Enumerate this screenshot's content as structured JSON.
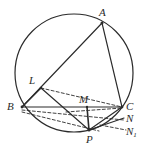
{
  "figure": {
    "type": "euclidean-geometry-diagram",
    "stroke_color": "#2b2b2b",
    "background_color": "#ffffff",
    "width": 146,
    "height": 151
  },
  "circle": {
    "name": "circumcircle",
    "cx": 74,
    "cy": 73,
    "r": 59,
    "stroke": "#2b2b2b",
    "stroke_width": 1.2,
    "fill": "none"
  },
  "points": [
    {
      "id": "A",
      "label": "A",
      "sub": "",
      "x": 102,
      "y": 23,
      "label_x": 99,
      "label_y": 7
    },
    {
      "id": "B",
      "label": "B",
      "sub": "",
      "x": 22,
      "y": 107,
      "label_x": 7,
      "label_y": 101
    },
    {
      "id": "C",
      "label": "C",
      "sub": "",
      "x": 122,
      "y": 107,
      "label_x": 126,
      "label_y": 101
    },
    {
      "id": "L",
      "label": "L",
      "sub": "",
      "x": 41,
      "y": 88,
      "label_x": 29,
      "label_y": 75
    },
    {
      "id": "M",
      "label": "M",
      "sub": "",
      "x": 87,
      "y": 107,
      "label_x": 79,
      "label_y": 94
    },
    {
      "id": "P",
      "label": "P",
      "sub": "",
      "x": 89,
      "y": 130,
      "label_x": 86,
      "label_y": 134
    },
    {
      "id": "N",
      "label": "N",
      "sub": "",
      "x": 122,
      "y": 114,
      "label_x": 126,
      "label_y": 113
    },
    {
      "id": "N1",
      "label": "N",
      "sub": "1",
      "x": 124,
      "y": 126,
      "label_x": 126,
      "label_y": 126
    }
  ],
  "solid_segments": [
    {
      "name": "segment-A-B",
      "from": "A",
      "to": "B",
      "x1": 102,
      "y1": 23,
      "x2": 22,
      "y2": 107
    },
    {
      "name": "segment-A-C",
      "from": "A",
      "to": "C",
      "x1": 102,
      "y1": 23,
      "x2": 122,
      "y2": 107
    },
    {
      "name": "segment-B-C",
      "from": "B",
      "to": "C",
      "x1": 22,
      "y1": 107,
      "x2": 122,
      "y2": 107
    },
    {
      "name": "segment-L-B",
      "from": "L",
      "to": "B",
      "x1": 41,
      "y1": 88,
      "x2": 22,
      "y2": 107
    },
    {
      "name": "segment-L-P",
      "from": "L",
      "to": "P",
      "x1": 41,
      "y1": 88,
      "x2": 89,
      "y2": 130
    },
    {
      "name": "segment-M-P",
      "from": "M",
      "to": "P",
      "x1": 87,
      "y1": 107,
      "x2": 89,
      "y2": 130
    },
    {
      "name": "segment-P-C",
      "from": "P",
      "to": "C",
      "x1": 89,
      "y1": 130,
      "x2": 122,
      "y2": 107
    },
    {
      "name": "segment-P-N",
      "from": "P",
      "to": "N",
      "x1": 89,
      "y1": 130,
      "x2": 124,
      "y2": 118
    }
  ],
  "dashed_segments": [
    {
      "name": "segment-L-C",
      "from": "L",
      "to": "C",
      "x1": 41,
      "y1": 88,
      "x2": 122,
      "y2": 107
    },
    {
      "name": "segment-B-N",
      "from": "B",
      "to": "N",
      "x1": 22,
      "y1": 110,
      "x2": 124,
      "y2": 120
    },
    {
      "name": "segment-B-P",
      "from": "B",
      "to": "P",
      "x1": 22,
      "y1": 112,
      "x2": 99,
      "y2": 131
    },
    {
      "name": "segment-M-C",
      "from": "M",
      "to": "C",
      "x1": 66,
      "y1": 112,
      "x2": 122,
      "y2": 108
    },
    {
      "name": "segment-P-N1",
      "from": "P",
      "to": "N1",
      "x1": 100,
      "y1": 125,
      "x2": 126,
      "y2": 130
    }
  ]
}
